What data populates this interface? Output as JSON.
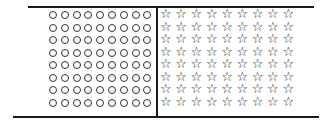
{
  "diagram": {
    "left_panel": {
      "shape": "circle",
      "symbol": "○",
      "rows": 8,
      "columns": 9
    },
    "right_panel": {
      "shape": "star",
      "symbol": "☆",
      "rows": 8,
      "columns": 9
    },
    "colors": {
      "ink": "#1a1a1a",
      "background": "#ffffff"
    }
  }
}
